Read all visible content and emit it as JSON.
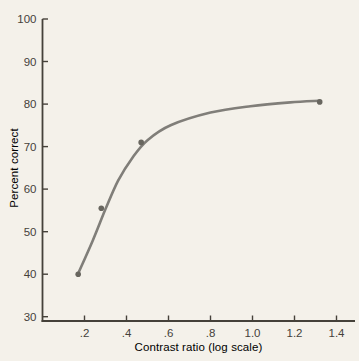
{
  "figure": {
    "colors": {
      "paper": "#f4f1ea",
      "ink": "#45413a",
      "curve": "#807e79",
      "point": "#68665f"
    }
  },
  "chart_data": {
    "type": "line",
    "title": "",
    "xlabel": "Contrast ratio (log scale)",
    "ylabel": "Percent correct",
    "xlim": [
      0,
      1.488
    ],
    "ylim": [
      29,
      100
    ],
    "grid": false,
    "legend": false,
    "x_ticks": [
      0.2,
      0.4,
      0.6,
      0.8,
      1.0,
      1.2,
      1.4
    ],
    "x_tick_labels": [
      ".2",
      ".4",
      ".6",
      ".8",
      "1.0",
      "1.2",
      "1.4"
    ],
    "y_ticks": [
      30,
      40,
      50,
      60,
      70,
      80,
      90,
      100
    ],
    "y_tick_labels": [
      "30",
      "40",
      "50",
      "60",
      "70",
      "80",
      "90",
      "100"
    ],
    "points": [
      [
        0.17,
        40
      ],
      [
        0.28,
        55.5
      ],
      [
        0.47,
        71
      ],
      [
        1.32,
        80.5
      ]
    ],
    "curve": [
      [
        0.17,
        40.2
      ],
      [
        0.24,
        48.0
      ],
      [
        0.3,
        55.3
      ],
      [
        0.36,
        62.0
      ],
      [
        0.43,
        67.5
      ],
      [
        0.5,
        71.5
      ],
      [
        0.61,
        75.0
      ],
      [
        0.8,
        78.0
      ],
      [
        0.99,
        79.5
      ],
      [
        1.18,
        80.4
      ],
      [
        1.32,
        80.8
      ]
    ]
  }
}
